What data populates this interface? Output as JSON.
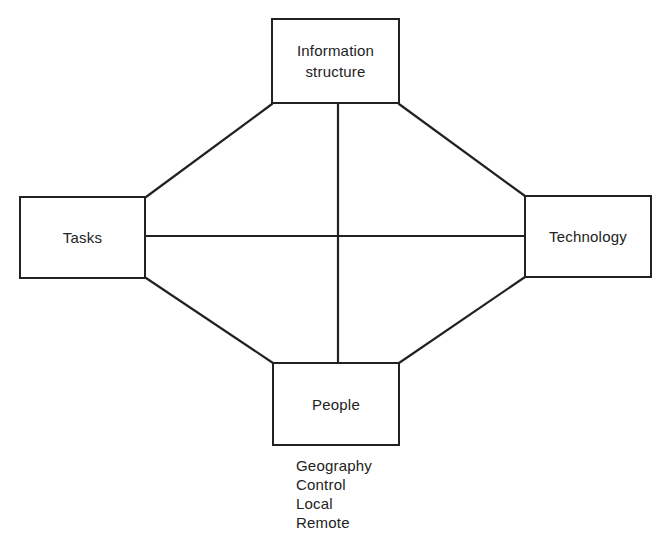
{
  "diagram": {
    "nodes": {
      "top": {
        "label": "Information\nstructure"
      },
      "left": {
        "label": "Tasks"
      },
      "right": {
        "label": "Technology"
      },
      "bottom": {
        "label": "People"
      }
    },
    "people_attributes": [
      "Geography",
      "Control",
      "Local",
      "Remote"
    ],
    "colors": {
      "line": "#222222",
      "background": "#ffffff",
      "text": "#222222"
    }
  }
}
